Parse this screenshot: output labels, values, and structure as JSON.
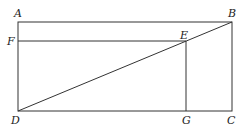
{
  "diagram": {
    "points": {
      "A": {
        "label": "A",
        "x": 18,
        "y": 22
      },
      "B": {
        "label": "B",
        "x": 232,
        "y": 22
      },
      "C": {
        "label": "C",
        "x": 232,
        "y": 111
      },
      "D": {
        "label": "D",
        "x": 18,
        "y": 111
      },
      "E": {
        "label": "E",
        "x": 186,
        "y": 41
      },
      "F": {
        "label": "F",
        "x": 18,
        "y": 41
      },
      "G": {
        "label": "G",
        "x": 186,
        "y": 111
      }
    },
    "segments": [
      "AB",
      "BC",
      "CD",
      "DA",
      "FE",
      "EG",
      "DB"
    ],
    "line_color": "#333333"
  }
}
